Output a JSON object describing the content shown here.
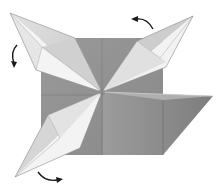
{
  "diagram": {
    "title": "Origami folding step: swing three points around",
    "type": "origami-fold-diagram",
    "colors": {
      "background": "#ffffff",
      "paper_dark": "#8c8c8c",
      "paper_mid": "#a6a6a6",
      "paper_light": "#d9d9d9",
      "paper_white": "#f4f4f4",
      "crease": "#6e6e6e",
      "arrow": "#1a1a1a"
    },
    "base_square": {
      "x": 41,
      "y": 38,
      "width": 122,
      "height": 117
    },
    "center": {
      "x": 102,
      "y": 92
    },
    "flaps": [
      {
        "id": "upper-left-point",
        "tip": {
          "x": 10,
          "y": 13
        }
      },
      {
        "id": "upper-right-point",
        "tip": {
          "x": 193,
          "y": 16
        }
      },
      {
        "id": "lower-left-point",
        "tip": {
          "x": 15,
          "y": 177
        }
      },
      {
        "id": "right-folded-flap",
        "tip": {
          "x": 213,
          "y": 96
        }
      }
    ],
    "arrows": [
      {
        "id": "arrow-left",
        "direction": "down",
        "meaning": "rotate flap"
      },
      {
        "id": "arrow-top",
        "direction": "left",
        "meaning": "rotate flap"
      },
      {
        "id": "arrow-bottom",
        "direction": "right",
        "meaning": "rotate flap"
      }
    ]
  }
}
